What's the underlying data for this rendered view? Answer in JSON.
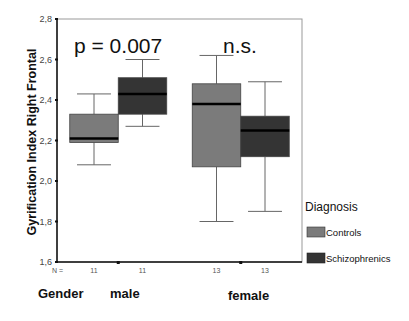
{
  "chart_data": {
    "type": "boxplot",
    "title": "",
    "ylabel": "Gyrification Index Right Frontal",
    "xlabel": "Gender",
    "ylim": [
      1.6,
      2.8
    ],
    "yticks": [
      1.6,
      1.8,
      2.0,
      2.2,
      2.4,
      2.6,
      2.8
    ],
    "ytick_labels": [
      "1,6",
      "1,8",
      "2,0",
      "2,2",
      "2,4",
      "2,6",
      "2,8"
    ],
    "grid": false,
    "categories": [
      "male",
      "female"
    ],
    "n_prefix": "N =",
    "annotations": [
      "p = 0.007",
      "n.s."
    ],
    "legend": {
      "title": "Diagnosis",
      "position": "right",
      "entries": [
        "Controls",
        "Schizophrenics"
      ]
    },
    "colors": {
      "Controls": "#7b7b7b",
      "Schizophrenics": "#343434"
    },
    "series": [
      {
        "name": "Controls",
        "n": [
          11,
          13
        ],
        "boxes": [
          {
            "whisker_low": 2.08,
            "q1": 2.19,
            "median": 2.21,
            "q3": 2.33,
            "whisker_high": 2.43
          },
          {
            "whisker_low": 1.8,
            "q1": 2.07,
            "median": 2.38,
            "q3": 2.48,
            "whisker_high": 2.62
          }
        ]
      },
      {
        "name": "Schizophrenics",
        "n": [
          11,
          13
        ],
        "boxes": [
          {
            "whisker_low": 2.27,
            "q1": 2.33,
            "median": 2.43,
            "q3": 2.51,
            "whisker_high": 2.6
          },
          {
            "whisker_low": 1.85,
            "q1": 2.12,
            "median": 2.25,
            "q3": 2.32,
            "whisker_high": 2.49
          }
        ]
      }
    ]
  }
}
